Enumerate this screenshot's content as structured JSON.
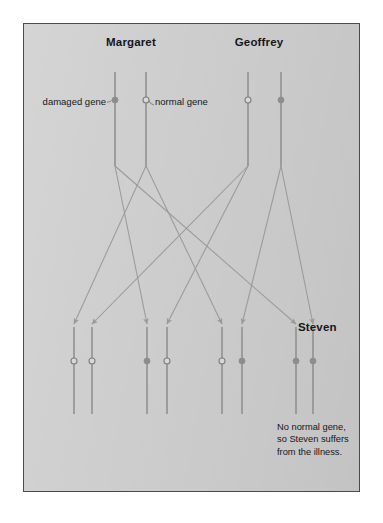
{
  "figure": {
    "background_color": "#cfcfcf",
    "page_color": "#ffffff",
    "border_color": "#4a4a4a",
    "chromosome_color": "#8d8d8d",
    "arrow_color": "#9a9a9a",
    "damaged_gene_color": "#8d8d8d",
    "normal_gene_fill": "#d8d8d8",
    "text_color": "#15161a"
  },
  "parents": [
    {
      "name": "Margaret",
      "label_x": 131,
      "label_y": 36,
      "chromosomes": [
        {
          "id": "m-damaged",
          "x": 115,
          "top": 72,
          "bottom": 166,
          "gene": "damaged"
        },
        {
          "id": "m-normal",
          "x": 146,
          "top": 72,
          "bottom": 166,
          "gene": "normal"
        }
      ]
    },
    {
      "name": "Geoffrey",
      "label_x": 259,
      "label_y": 36,
      "chromosomes": [
        {
          "id": "g-normal",
          "x": 248,
          "top": 72,
          "bottom": 166,
          "gene": "normal"
        },
        {
          "id": "g-damaged",
          "x": 281,
          "top": 72,
          "bottom": 166,
          "gene": "damaged"
        }
      ]
    }
  ],
  "gene_marker_y": 100,
  "annotations": [
    {
      "text": "damaged gene",
      "x": 106,
      "y": 96,
      "align": "right",
      "points_to": "m-damaged"
    },
    {
      "text": "normal gene",
      "x": 155,
      "y": 96,
      "align": "left",
      "points_to": "m-normal"
    }
  ],
  "children": [
    {
      "id": "child-1",
      "name": "",
      "chromosomes": [
        {
          "x": 74,
          "top": 327,
          "bottom": 414,
          "gene": "normal",
          "from": "m-normal"
        },
        {
          "x": 92,
          "top": 327,
          "bottom": 414,
          "gene": "normal",
          "from": "g-normal"
        }
      ]
    },
    {
      "id": "child-2",
      "name": "",
      "chromosomes": [
        {
          "x": 147,
          "top": 327,
          "bottom": 414,
          "gene": "damaged",
          "from": "m-damaged"
        },
        {
          "x": 167,
          "top": 327,
          "bottom": 414,
          "gene": "normal",
          "from": "g-normal"
        }
      ]
    },
    {
      "id": "child-3",
      "name": "",
      "chromosomes": [
        {
          "x": 222,
          "top": 327,
          "bottom": 414,
          "gene": "normal",
          "from": "m-normal"
        },
        {
          "x": 242,
          "top": 327,
          "bottom": 414,
          "gene": "damaged",
          "from": "g-damaged"
        }
      ]
    },
    {
      "id": "child-4",
      "name": "Steven",
      "name_x": 298,
      "name_y": 321,
      "chromosomes": [
        {
          "x": 296,
          "top": 327,
          "bottom": 414,
          "gene": "damaged",
          "from": "m-damaged"
        },
        {
          "x": 313,
          "top": 327,
          "bottom": 414,
          "gene": "damaged",
          "from": "g-damaged"
        }
      ]
    }
  ],
  "caption": {
    "text": "No normal gene,\nso Steven suffers\nfrom the illness.",
    "x": 277,
    "y": 421
  },
  "legend": {
    "damaged_label": "damaged gene",
    "normal_label": "normal gene"
  }
}
